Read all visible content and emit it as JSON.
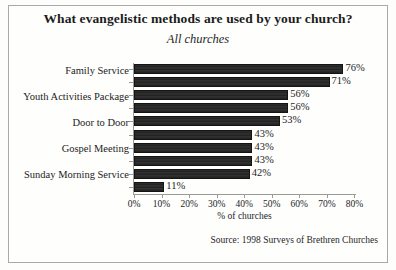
{
  "chart_data": {
    "type": "bar",
    "orientation": "horizontal",
    "title": "What evangelistic methods are used by your church?",
    "subtitle": "All churches",
    "xlabel": "% of churches",
    "ylabel": "",
    "xlim": [
      0,
      80
    ],
    "xticks": [
      "0%",
      "10%",
      "20%",
      "30%",
      "40%",
      "50%",
      "60%",
      "70%",
      "80%"
    ],
    "xtick_values": [
      0,
      10,
      20,
      30,
      40,
      50,
      60,
      70,
      80
    ],
    "grid": false,
    "legend": false,
    "bar_color": "#282828",
    "categories": [
      "Family Service",
      "",
      "Youth Activities Package",
      "",
      "Door to Door",
      "",
      "Gospel Meeting",
      "",
      "Sunday Morning Service",
      ""
    ],
    "visible_category_labels": [
      "Family Service",
      "Youth Activities Package",
      "Door to Door",
      "Gospel Meeting",
      "Sunday Morning Service"
    ],
    "values": [
      76,
      71,
      56,
      56,
      53,
      43,
      43,
      43,
      42,
      11
    ],
    "data_labels": [
      "76%",
      "71%",
      "56%",
      "56%",
      "53%",
      "43%",
      "43%",
      "43%",
      "42%",
      "11%"
    ],
    "source": "Source: 1998 Surveys of Brethren Churches"
  }
}
